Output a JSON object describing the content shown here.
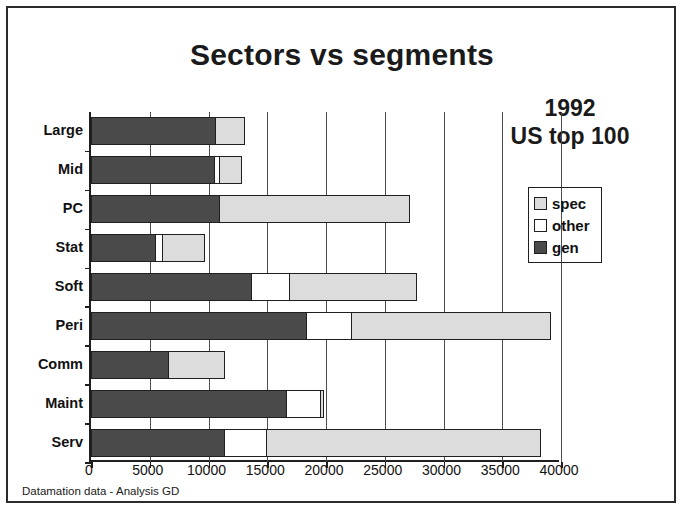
{
  "figure": {
    "title": "Sectors vs segments",
    "annotation_lines": [
      "1992",
      "US top 100"
    ],
    "footer": "Datamation data - Analysis GD"
  },
  "legend": {
    "position": "inside-right",
    "entries": [
      {
        "label": "spec",
        "color": "#dcdcdc",
        "icon": "legend-swatch-icon"
      },
      {
        "label": "other",
        "color": "#ffffff",
        "icon": "legend-swatch-icon"
      },
      {
        "label": "gen",
        "color": "#4a4a4a",
        "icon": "legend-swatch-icon"
      }
    ]
  },
  "chart_data": {
    "type": "bar",
    "orientation": "horizontal",
    "stacked": true,
    "title": "Sectors vs segments",
    "xlabel": "",
    "ylabel": "",
    "xlim": [
      0,
      40000
    ],
    "xticks": [
      0,
      5000,
      10000,
      15000,
      20000,
      25000,
      30000,
      35000,
      40000
    ],
    "xtick_labels": [
      "0",
      "5000",
      "10000",
      "15000",
      "20000",
      "25000",
      "30000",
      "35000",
      "40000"
    ],
    "grid": "vertical",
    "categories": [
      "Large",
      "Mid",
      "PC",
      "Stat",
      "Soft",
      "Peri",
      "Comm",
      "Maint",
      "Serv"
    ],
    "series": [
      {
        "name": "gen",
        "color": "#4a4a4a",
        "values": [
          10700,
          10600,
          11000,
          5600,
          13700,
          18400,
          6700,
          16700,
          11400
        ]
      },
      {
        "name": "other",
        "color": "#ffffff",
        "values": [
          0,
          500,
          0,
          700,
          3400,
          4000,
          0,
          3000,
          3700
        ]
      },
      {
        "name": "spec",
        "color": "#dcdcdc",
        "values": [
          2500,
          2000,
          16300,
          3600,
          10900,
          17000,
          4800,
          400,
          23400
        ]
      }
    ],
    "totals": [
      13200,
      13100,
      27300,
      9900,
      28000,
      39400,
      11500,
      20100,
      38500
    ]
  }
}
